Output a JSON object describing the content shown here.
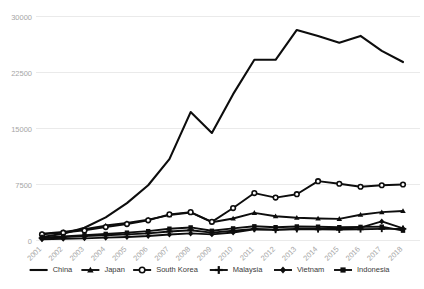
{
  "chart_data": {
    "type": "line",
    "title": "",
    "xlabel": "",
    "ylabel": "",
    "x": [
      "2001",
      "2002",
      "2003",
      "2004",
      "2005",
      "2006",
      "2007",
      "2008",
      "2009",
      "2010",
      "2011",
      "2012",
      "2013",
      "2014",
      "2015",
      "2016",
      "2017",
      "2018"
    ],
    "ylim": [
      0,
      30000
    ],
    "yticks": [
      0,
      7500,
      15000,
      22500,
      30000
    ],
    "ytick_labels": [
      "0",
      "7500",
      "15000",
      "22500",
      "30000"
    ],
    "grid": true,
    "legend_position": "bottom",
    "series": [
      {
        "name": "China",
        "marker": "none",
        "values": [
          480,
          900,
          1700,
          3100,
          5000,
          7400,
          10900,
          17200,
          14400,
          19600,
          24200,
          24200,
          28200,
          27400,
          26500,
          27400,
          25400,
          23900
        ]
      },
      {
        "name": "Japan",
        "marker": "triangle",
        "values": [
          900,
          1150,
          1500,
          2000,
          2350,
          2800,
          3400,
          3750,
          2450,
          2950,
          3700,
          3250,
          3050,
          2950,
          2900,
          3450,
          3800,
          3950
        ]
      },
      {
        "name": "South Korea",
        "marker": "circle",
        "values": [
          820,
          1050,
          1350,
          1800,
          2200,
          2700,
          3500,
          3800,
          2500,
          4350,
          6350,
          5750,
          6200,
          7950,
          7600,
          7200,
          7400,
          7500
        ]
      },
      {
        "name": "Malaysia",
        "marker": "cross",
        "values": [
          330,
          450,
          580,
          700,
          820,
          960,
          1200,
          1380,
          1050,
          1300,
          1550,
          1420,
          1520,
          1500,
          1450,
          1500,
          1560,
          1560
        ]
      },
      {
        "name": "Vietnam",
        "marker": "diamond",
        "values": [
          170,
          230,
          290,
          380,
          470,
          600,
          800,
          950,
          820,
          1080,
          1500,
          1460,
          1550,
          1580,
          1580,
          1720,
          2550,
          1620
        ]
      },
      {
        "name": "Indonesia",
        "marker": "square",
        "values": [
          390,
          540,
          700,
          880,
          1050,
          1250,
          1580,
          1750,
          1300,
          1620,
          1900,
          1780,
          1880,
          1850,
          1780,
          1820,
          1850,
          1320
        ]
      }
    ]
  },
  "legend": {
    "items": [
      {
        "label": "China"
      },
      {
        "label": "Japan"
      },
      {
        "label": "South Korea"
      },
      {
        "label": "Malaysia"
      },
      {
        "label": "Vietnam"
      },
      {
        "label": "Indonesia"
      }
    ]
  },
  "colors": {
    "series": "#0d0d0d",
    "grid": "#eaeaea",
    "tick_text": "#a6a6a6",
    "legend_text": "#3a3a3a",
    "background": "#ffffff"
  }
}
